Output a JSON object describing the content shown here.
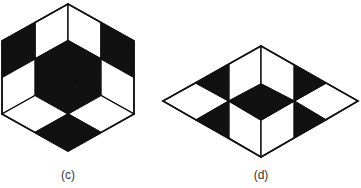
{
  "colors": {
    "ink": "#111111",
    "paper": "#ffffff",
    "label": "#333333"
  },
  "figures": [
    {
      "id": "c",
      "label": "(c)",
      "shape": "hexagon subdivided into three rhombic faces, each split 2x2",
      "cells": [
        {
          "face": "left",
          "row": 0,
          "col": 0,
          "fill": "white"
        },
        {
          "face": "left",
          "row": 0,
          "col": 1,
          "fill": "black"
        },
        {
          "face": "left",
          "row": 1,
          "col": 0,
          "fill": "black"
        },
        {
          "face": "left",
          "row": 1,
          "col": 1,
          "fill": "white"
        },
        {
          "face": "right",
          "row": 0,
          "col": 0,
          "fill": "white"
        },
        {
          "face": "right",
          "row": 0,
          "col": 1,
          "fill": "black"
        },
        {
          "face": "right",
          "row": 1,
          "col": 0,
          "fill": "black"
        },
        {
          "face": "right",
          "row": 1,
          "col": 1,
          "fill": "white"
        },
        {
          "face": "bottom",
          "row": 0,
          "col": 0,
          "fill": "black"
        },
        {
          "face": "bottom",
          "row": 0,
          "col": 1,
          "fill": "white"
        },
        {
          "face": "bottom",
          "row": 1,
          "col": 0,
          "fill": "white"
        },
        {
          "face": "bottom",
          "row": 1,
          "col": 1,
          "fill": "black"
        }
      ]
    },
    {
      "id": "d",
      "label": "(d)",
      "shape": "flattened diamond with central black rhombus, side white rhombi and black triangles",
      "regions": [
        {
          "name": "center-rhombus",
          "fill": "black"
        },
        {
          "name": "left-rhombus",
          "fill": "white"
        },
        {
          "name": "right-rhombus",
          "fill": "white"
        },
        {
          "name": "left-upper-triangle",
          "fill": "black"
        },
        {
          "name": "left-lower-triangle",
          "fill": "black"
        },
        {
          "name": "right-upper-triangle",
          "fill": "black"
        },
        {
          "name": "right-lower-triangle",
          "fill": "black"
        },
        {
          "name": "upper-left-panel",
          "fill": "white"
        },
        {
          "name": "upper-right-panel",
          "fill": "white"
        },
        {
          "name": "lower-left-panel",
          "fill": "white"
        },
        {
          "name": "lower-right-panel",
          "fill": "white"
        }
      ]
    }
  ]
}
